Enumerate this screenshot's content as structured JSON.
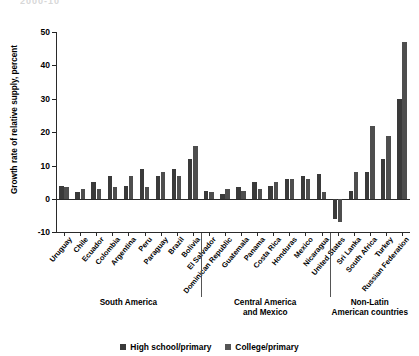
{
  "figure": {
    "cropped_header_text": "2000-10",
    "ylabel": "Growth rate of relative supply, percent",
    "group_labels": [
      "South America",
      "Central America\nand Mexico",
      "Non-Latin\nAmerican countries"
    ],
    "legend": [
      {
        "label": "High school/primary",
        "color": "#3a3a3a"
      },
      {
        "label": "College/primary",
        "color": "#555555"
      }
    ]
  },
  "chart_data": {
    "type": "bar",
    "title": "",
    "xlabel": "",
    "ylabel": "Growth rate of relative supply, percent",
    "ylim": [
      -10,
      50
    ],
    "yticks": [
      -10,
      0,
      10,
      20,
      30,
      40,
      50
    ],
    "ytick_labels": [
      "-10",
      "0",
      "10",
      "20",
      "30",
      "40",
      "50"
    ],
    "grid": false,
    "legend_position": "bottom-center",
    "categories": [
      "Uruguay",
      "Chile",
      "Ecuador",
      "Colombia",
      "Argentina",
      "Peru",
      "Paraguay",
      "Brazil",
      "Bolivia",
      "El Salvador",
      "Dominican Republic",
      "Guatemala",
      "Panama",
      "Costa Rica",
      "Honduras",
      "Mexico",
      "Nicaragua",
      "United States",
      "Sri Lanka",
      "South Africa",
      "Turkey",
      "Russian Federation"
    ],
    "groups": [
      {
        "name": "South America",
        "start": 0,
        "end": 8
      },
      {
        "name": "Central America and Mexico",
        "start": 9,
        "end": 16
      },
      {
        "name": "Non-Latin American countries",
        "start": 17,
        "end": 21
      }
    ],
    "series": [
      {
        "name": "High school/primary",
        "color": "#3a3a3a",
        "values": [
          4,
          2,
          5,
          7,
          4,
          9,
          7,
          9,
          12,
          2.5,
          1.5,
          3.5,
          5,
          4,
          6,
          7,
          7.5,
          -6,
          2.5,
          8,
          12,
          30
        ]
      },
      {
        "name": "College/primary",
        "color": "#555555",
        "values": [
          3.5,
          3,
          3,
          3.5,
          7,
          3.5,
          8,
          7,
          16,
          2,
          3,
          2.5,
          3,
          5,
          6,
          6,
          2,
          -7,
          8,
          22,
          19,
          47
        ]
      }
    ]
  }
}
